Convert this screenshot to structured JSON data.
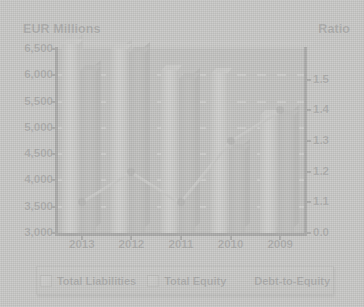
{
  "chart_data": {
    "type": "bar",
    "title": "",
    "categories": [
      "2013",
      "2012",
      "2011",
      "2010",
      "2009"
    ],
    "xlabel": "",
    "ylabel": "EUR Millions",
    "y2label": "Ratio",
    "ylim": [
      3000,
      6500
    ],
    "y2lim": [
      1.0,
      1.6
    ],
    "y_ticks": [
      "6,500",
      "6,000",
      "5,500",
      "5,000",
      "4,500",
      "4,000",
      "3,500",
      "3,000"
    ],
    "y_tick_values": [
      6500,
      6000,
      5500,
      5000,
      4500,
      4000,
      3500,
      3000
    ],
    "y2_ticks": [
      "1.5",
      "1.4",
      "1.3",
      "1.2",
      "1.1",
      "0.0"
    ],
    "y2_tick_values": [
      1.5,
      1.4,
      1.3,
      1.2,
      1.1,
      1.0
    ],
    "grid": true,
    "legend_position": "bottom",
    "series": [
      {
        "name": "Total Liabilities",
        "type": "bar",
        "axis": "left",
        "color": "#ededea",
        "values": [
          6600,
          6500,
          6100,
          6050,
          5250
        ]
      },
      {
        "name": "Total Equity",
        "type": "bar",
        "axis": "left",
        "color": "#949492",
        "values": [
          6100,
          6450,
          5950,
          4600,
          5250
        ]
      },
      {
        "name": "Debt-to-Equity",
        "type": "line",
        "axis": "right",
        "color": "#c9c9c6",
        "values": [
          1.1,
          1.2,
          1.1,
          1.3,
          1.4
        ]
      }
    ]
  },
  "axes": {
    "left_title": "EUR Millions",
    "right_title": "Ratio"
  },
  "legend": {
    "items": [
      {
        "label": "Total Liabilities",
        "swatch": "liab"
      },
      {
        "label": "Total Equity",
        "swatch": "eq"
      },
      {
        "label": "Debt-to-Equity",
        "swatch": "line"
      }
    ]
  },
  "colors": {
    "background": "#c9c9c7",
    "plot_area": "#a3a3a0",
    "gridline": "#f2f2f0",
    "axis": "#1a1a1c",
    "bar_liabilities": "#ededea",
    "bar_equity": "#949492",
    "line": "#c9c9c6",
    "marker": "#5c5c5a"
  }
}
